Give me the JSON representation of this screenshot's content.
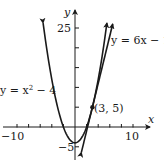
{
  "chart_data": {
    "type": "line",
    "title": "",
    "xlabel": "x",
    "ylabel": "y",
    "xlim": [
      -11,
      12
    ],
    "ylim": [
      -7,
      28
    ],
    "grid": false,
    "x_ticks": [
      -10,
      -8,
      -6,
      -4,
      -2,
      0,
      2,
      4,
      6,
      8,
      10
    ],
    "x_tick_labels": [
      "-10",
      "10"
    ],
    "y_ticks": [
      -5,
      0,
      5,
      10,
      15,
      20,
      25
    ],
    "y_tick_labels": [
      "-5",
      "25"
    ],
    "series": [
      {
        "name": "y = x^2 - 4",
        "equation": "x^2 - 4",
        "kind": "parabola",
        "x_range": [
          -5.5,
          5.5
        ]
      },
      {
        "name": "y = 6x - 13",
        "equation": "6x - 13",
        "kind": "line",
        "x_range": [
          1.1,
          6.5
        ]
      }
    ],
    "annotations": [
      {
        "text": "(3, 5)",
        "point": [
          3,
          5
        ],
        "note": "tangent point"
      }
    ]
  },
  "labels": {
    "y_axis": "y",
    "x_axis": "x",
    "y25": "25",
    "yneg5": "−5",
    "xneg10": "−10",
    "x10": "10",
    "parabola_eq_prefix": "y = x",
    "parabola_exp": "2",
    "parabola_eq_suffix": " − 4",
    "line_eq": "y = 6x − 13",
    "point_label": "(3, 5)"
  },
  "colors": {
    "ink": "#1a1a1a",
    "background": "#ffffff"
  }
}
